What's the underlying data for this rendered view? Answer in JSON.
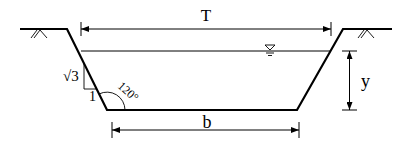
{
  "diagram": {
    "labels": {
      "top_width": "T",
      "bottom_width": "b",
      "depth": "y",
      "slope_vertical": "√3",
      "slope_horizontal": "1",
      "angle": "120°"
    },
    "symbols": {
      "water_surface": "water-surface-triangle",
      "ground_hatch": "ground-hatch"
    },
    "colors": {
      "line": "#000000",
      "background": "#ffffff"
    }
  }
}
